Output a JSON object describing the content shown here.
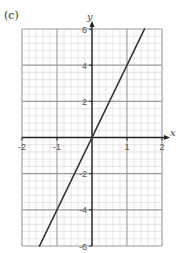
{
  "panel_label": "(c)",
  "colors": {
    "minor_grid": "#d4d4d4",
    "major_grid": "#9a9a9a",
    "axis": "#222222",
    "line": "#2e2e2e",
    "text": "#555555"
  },
  "chart_data": {
    "type": "line",
    "title": "",
    "xlabel": "x",
    "ylabel": "y",
    "xlim": [
      -2,
      2
    ],
    "ylim": [
      -6,
      6
    ],
    "x_major_step": 1,
    "x_minor_step": 0.2,
    "y_major_step": 2,
    "y_minor_step": 0.4,
    "grid": true,
    "x_ticks": [
      {
        "value": -2,
        "label": "-2"
      },
      {
        "value": -1,
        "label": "-1"
      },
      {
        "value": 1,
        "label": "1"
      },
      {
        "value": 2,
        "label": "2"
      }
    ],
    "y_ticks": [
      {
        "value": 6,
        "label": "6"
      },
      {
        "value": 4,
        "label": "4"
      },
      {
        "value": 2,
        "label": "2"
      },
      {
        "value": -2,
        "label": "-2"
      },
      {
        "value": -4,
        "label": "-4"
      },
      {
        "value": -6,
        "label": "-6"
      }
    ],
    "series": [
      {
        "name": "y = 4x",
        "x": [
          -1.5,
          1.5
        ],
        "y": [
          -6,
          6
        ]
      }
    ]
  }
}
